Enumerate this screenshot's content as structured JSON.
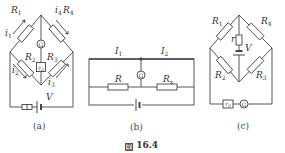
{
  "figure": {
    "caption": "图 16.4",
    "caption_symbol": "图",
    "caption_number": "16.4"
  },
  "panels": [
    {
      "id": "a",
      "label": "(a)",
      "labels": {
        "R1": "R",
        "R1_sub": "1",
        "R4": "R",
        "R4_sub": "4",
        "R2": "R",
        "R2_sub": "2",
        "R3": "R",
        "R3_sub": "3",
        "i1": "i",
        "i1_sub": "1",
        "i4": "i",
        "i4_sub": "4",
        "i2": "i",
        "i2_sub": "2",
        "i3": "i",
        "i3_sub": "3",
        "V": "V",
        "G": "G",
        "rG": "r",
        "rG_sub": "G"
      }
    },
    {
      "id": "b",
      "label": "(b)",
      "labels": {
        "I1": "I",
        "I1_sub": "1",
        "I2": "I",
        "I2_sub": "2",
        "R": "R",
        "Rx": "R",
        "Rx_sub": "x",
        "G": "G"
      }
    },
    {
      "id": "c",
      "label": "(c)",
      "labels": {
        "R1": "R",
        "R1_sub": "1",
        "R4": "R",
        "R4_sub": "4",
        "R2": "R",
        "R2_sub": "2",
        "R3": "R",
        "R3_sub": "3",
        "r": "r",
        "V": "V",
        "G": "G",
        "rG": "r",
        "rG_sub": "G"
      }
    }
  ],
  "colors": {
    "line": "#444444",
    "background": "#ffffff"
  }
}
